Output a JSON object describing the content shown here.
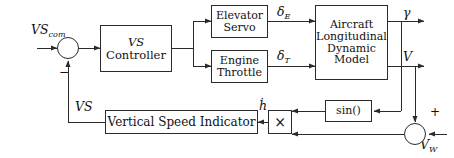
{
  "diagram": {
    "type": "control-block-diagram",
    "line_color": "#2b2b2b",
    "text_color": "#111111",
    "background": "#ffffff"
  },
  "blocks": {
    "vs_controller": {
      "line1": "VS",
      "line2": "Controller"
    },
    "elevator_servo": {
      "line1": "Elevator",
      "line2": "Servo"
    },
    "engine_throttle": {
      "line1": "Engine",
      "line2": "Throttle"
    },
    "aircraft_model": {
      "line1": "Aircraft",
      "line2": "Longitudinal",
      "line3": "Dynamic",
      "line4": "Model"
    },
    "vertical_speed_indicator": {
      "label": "Vertical Speed Indicator"
    },
    "sin_block": {
      "label": "sin()"
    },
    "multiplier": {
      "symbol": "×"
    }
  },
  "signals": {
    "vs_command": {
      "base": "VS",
      "subscript": "com"
    },
    "delta_elevator": {
      "base": "δ",
      "subscript": "E"
    },
    "delta_throttle": {
      "base": "δ",
      "subscript": "T"
    },
    "gamma": {
      "label": "γ"
    },
    "velocity": {
      "label": "V"
    },
    "vs_feedback": {
      "label": "VS"
    },
    "h_dot": {
      "label": "ḣ"
    },
    "wind_velocity": {
      "base": "V",
      "subscript": "W"
    }
  },
  "signs": {
    "summing_negative": "−",
    "summing_positive": "+"
  }
}
